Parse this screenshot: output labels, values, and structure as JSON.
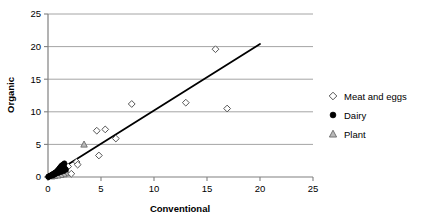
{
  "chart_data": {
    "type": "scatter",
    "title": "",
    "xlabel": "Conventional",
    "ylabel": "Organic",
    "xlim": [
      0,
      25
    ],
    "ylim": [
      0,
      25
    ],
    "xticks": [
      0,
      5,
      10,
      15,
      20,
      25
    ],
    "yticks": [
      0,
      5,
      10,
      15,
      20,
      25
    ],
    "xtick_labels": [
      "0",
      "5",
      "10",
      "15",
      "20",
      "25"
    ],
    "ytick_labels": [
      "0",
      "5",
      "10",
      "15",
      "20",
      "25"
    ],
    "grid": "horizontal",
    "legend_position": "right",
    "series": [
      {
        "name": "Meat and eggs",
        "marker": "open-diamond",
        "color": "#ffffff",
        "edge_color": "#555555",
        "points": [
          [
            15.8,
            19.6
          ],
          [
            13.0,
            11.4
          ],
          [
            16.9,
            10.5
          ],
          [
            7.9,
            11.2
          ],
          [
            5.4,
            7.3
          ],
          [
            4.6,
            7.1
          ],
          [
            6.4,
            5.9
          ],
          [
            4.8,
            3.3
          ],
          [
            2.7,
            2.3
          ],
          [
            2.8,
            1.9
          ],
          [
            1.9,
            1.6
          ],
          [
            1.6,
            1.3
          ],
          [
            1.3,
            1.1
          ],
          [
            1.1,
            0.9
          ],
          [
            0.9,
            0.7
          ],
          [
            0.7,
            0.6
          ],
          [
            0.5,
            0.4
          ],
          [
            2.2,
            0.5
          ]
        ]
      },
      {
        "name": "Dairy",
        "marker": "filled-circle",
        "color": "#000000",
        "edge_color": "#000000",
        "points": [
          [
            1.55,
            2.1
          ],
          [
            1.45,
            1.95
          ],
          [
            1.35,
            1.85
          ],
          [
            1.5,
            1.75
          ],
          [
            1.25,
            1.7
          ],
          [
            1.4,
            1.6
          ],
          [
            1.2,
            1.55
          ],
          [
            1.3,
            1.45
          ],
          [
            1.1,
            1.4
          ],
          [
            1.25,
            1.3
          ],
          [
            1.05,
            1.25
          ],
          [
            1.15,
            1.15
          ],
          [
            0.95,
            1.1
          ],
          [
            1.0,
            1.0
          ],
          [
            0.9,
            0.95
          ],
          [
            0.85,
            0.88
          ],
          [
            0.8,
            0.8
          ],
          [
            0.75,
            0.72
          ],
          [
            0.7,
            0.68
          ],
          [
            0.62,
            0.6
          ],
          [
            0.58,
            0.55
          ],
          [
            0.5,
            0.48
          ],
          [
            0.45,
            0.42
          ],
          [
            0.4,
            0.38
          ],
          [
            0.35,
            0.32
          ],
          [
            0.3,
            0.28
          ],
          [
            0.25,
            0.22
          ],
          [
            0.2,
            0.18
          ],
          [
            0.15,
            0.14
          ],
          [
            0.12,
            0.1
          ],
          [
            0.09,
            0.08
          ],
          [
            0.06,
            0.06
          ],
          [
            0.04,
            0.04
          ],
          [
            0.02,
            0.02
          ],
          [
            1.6,
            1.3
          ],
          [
            1.7,
            1.1
          ],
          [
            1.45,
            0.9
          ],
          [
            1.2,
            0.75
          ],
          [
            0.95,
            0.6
          ],
          [
            0.7,
            0.45
          ],
          [
            0.55,
            0.3
          ],
          [
            0.4,
            0.2
          ]
        ]
      },
      {
        "name": "Plant",
        "marker": "open-triangle",
        "color": "#b9b9b9",
        "edge_color": "#6a6a6a",
        "points": [
          [
            3.4,
            5.0
          ],
          [
            1.8,
            0.6
          ],
          [
            1.5,
            0.45
          ],
          [
            1.2,
            0.35
          ],
          [
            0.9,
            0.25
          ],
          [
            0.6,
            0.18
          ],
          [
            0.35,
            0.12
          ]
        ]
      }
    ],
    "trend_line": {
      "name": "trend-line",
      "from": [
        0.0,
        0.0
      ],
      "to": [
        20.0,
        20.4
      ],
      "color": "#000000"
    }
  },
  "legend": {
    "items": [
      {
        "label": "Meat and eggs",
        "marker": "open-diamond"
      },
      {
        "label": "Dairy",
        "marker": "filled-circle"
      },
      {
        "label": "Plant",
        "marker": "open-triangle"
      }
    ]
  },
  "axes": {
    "x_title": "Conventional",
    "y_title": "Organic"
  }
}
